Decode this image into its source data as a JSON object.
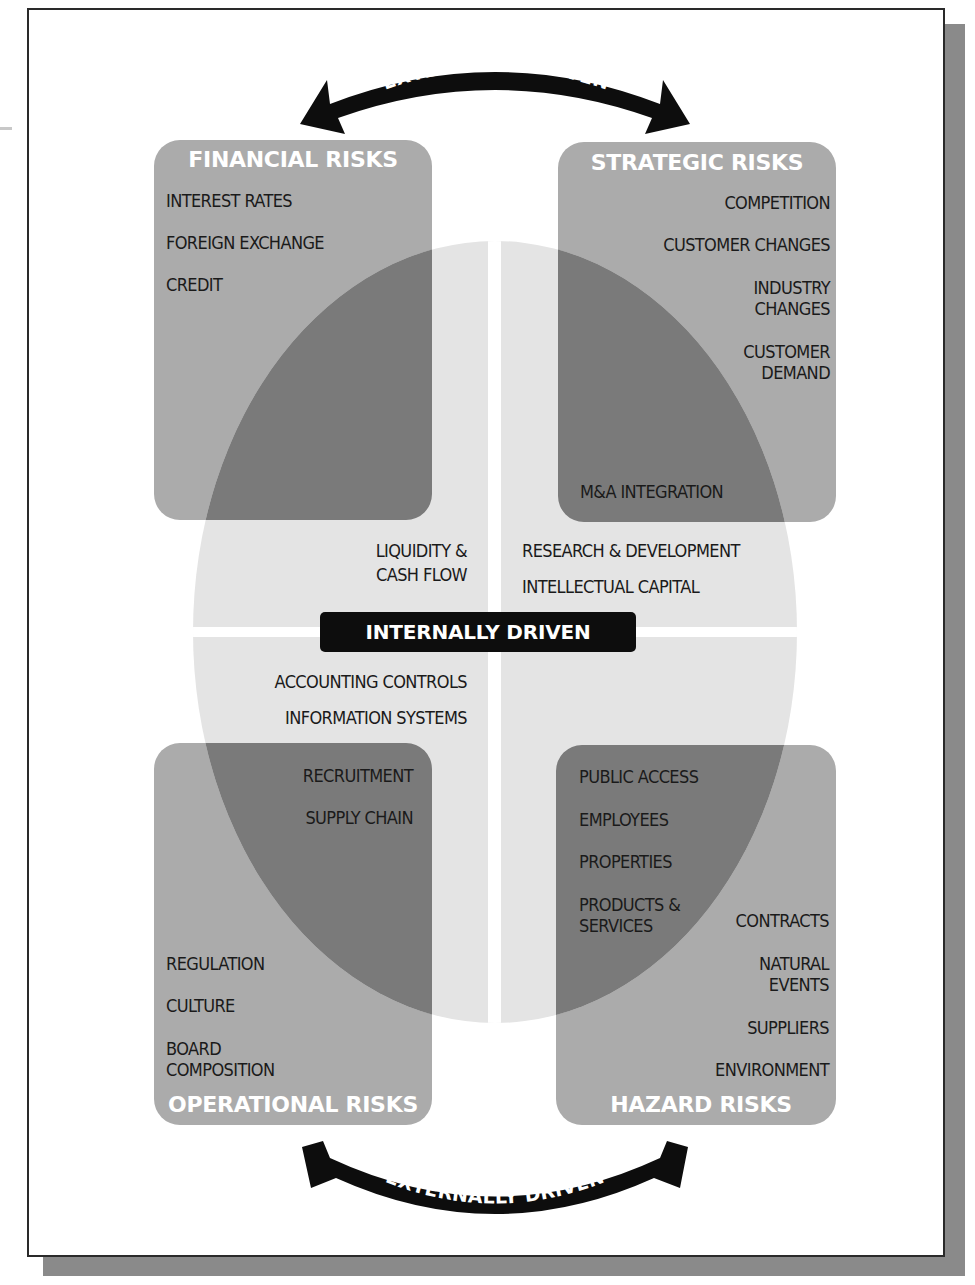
{
  "diagram": {
    "top_arrow": {
      "label": "EXTERNALLY DRIVEN",
      "icon": "double-headed-curved-arrow"
    },
    "bottom_arrow": {
      "label": "EXTERNALLY DRIVEN",
      "icon": "double-headed-curved-arrow"
    },
    "center": {
      "label": "INTERNALLY DRIVEN"
    },
    "colors": {
      "box_fill": "#ababab",
      "ellipse_fill": "#e4e4e4",
      "overlap_fill": "#7a7a7a",
      "arrow_fill": "#0d0d0d",
      "badge_fill": "#0d0d0d",
      "title_text": "#ffffff",
      "body_text": "#1a1a1a"
    },
    "quadrants": {
      "financial": {
        "title": "FINANCIAL RISKS",
        "items": [
          "INTEREST RATES",
          "FOREIGN EXCHANGE",
          "CREDIT"
        ],
        "internal_items": [
          "LIQUIDITY &",
          "CASH FLOW"
        ]
      },
      "strategic": {
        "title": "STRATEGIC RISKS",
        "items": [
          "COMPETITION",
          "CUSTOMER CHANGES",
          "INDUSTRY",
          "CHANGES",
          "CUSTOMER",
          "DEMAND",
          "M&A INTEGRATION"
        ],
        "internal_items": [
          "RESEARCH & DEVELOPMENT",
          "INTELLECTUAL CAPITAL"
        ]
      },
      "operational": {
        "title": "OPERATIONAL RISKS",
        "internal_items": [
          "ACCOUNTING CONTROLS",
          "INFORMATION SYSTEMS"
        ],
        "items": [
          "RECRUITMENT",
          "SUPPLY CHAIN",
          "REGULATION",
          "CULTURE",
          "BOARD",
          "COMPOSITION"
        ]
      },
      "hazard": {
        "title": "HAZARD RISKS",
        "items": [
          "PUBLIC ACCESS",
          "EMPLOYEES",
          "PROPERTIES",
          "PRODUCTS &",
          "SERVICES",
          "CONTRACTS",
          "NATURAL",
          "EVENTS",
          "SUPPLIERS",
          "ENVIRONMENT"
        ]
      }
    }
  }
}
